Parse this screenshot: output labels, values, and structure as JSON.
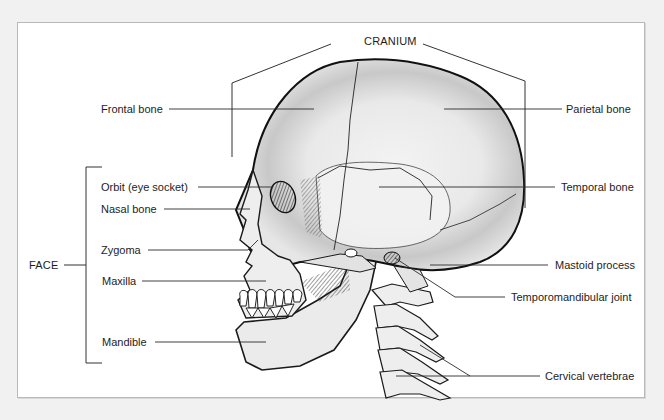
{
  "diagram": {
    "groups": {
      "cranium": "CRANIUM",
      "face": "FACE"
    },
    "labels": {
      "frontal_bone": "Frontal bone",
      "parietal_bone": "Parietal bone",
      "orbit": "Orbit (eye socket)",
      "temporal_bone": "Temporal bone",
      "nasal_bone": "Nasal bone",
      "zygoma": "Zygoma",
      "maxilla": "Maxilla",
      "mastoid_process": "Mastoid process",
      "temporomandibular_joint": "Temporomandibular joint",
      "mandible": "Mandible",
      "cervical_vertebrae": "Cervical vertebrae"
    },
    "colors": {
      "background": "#f1f1f1",
      "panel": "#ffffff",
      "ink": "#1d1d1d",
      "bone": "#ececec",
      "bone_shade": "#c9c9c9"
    }
  }
}
